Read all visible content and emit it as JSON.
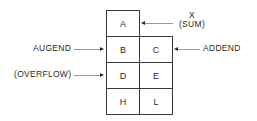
{
  "registers": {
    "A": "A",
    "B": "B",
    "C": "C",
    "D": "D",
    "E": "E",
    "H": "H",
    "L": "L"
  },
  "labels": {
    "sum_x": "X",
    "sum": "(SUM)",
    "augend": "AUGEND",
    "addend": "ADDEND",
    "overflow": "(OVERFLOW)"
  }
}
